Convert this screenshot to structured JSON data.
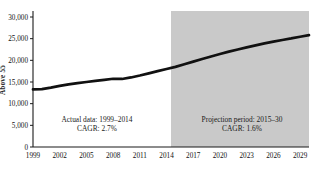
{
  "chart_data": {
    "type": "line",
    "title": "",
    "subtitle": "",
    "xlabel": "",
    "ylabel": "Above 55",
    "ylim": [
      0,
      30000
    ],
    "xlim": [
      1999,
      2030
    ],
    "ytick_labels": [
      "30,000",
      "25,000",
      "20,000",
      "15,000",
      "10,000",
      "5,000",
      "0"
    ],
    "ytick_values": [
      30000,
      25000,
      20000,
      15000,
      10000,
      5000,
      0
    ],
    "xtick_labels": [
      "1999",
      "2002",
      "2005",
      "2008",
      "2011",
      "2014",
      "2017",
      "2020",
      "2023",
      "2026",
      "2029"
    ],
    "xtick_values": [
      1999,
      2002,
      2005,
      2008,
      2011,
      2014,
      2017,
      2020,
      2023,
      2026,
      2029
    ],
    "grid": false,
    "legend_position": "none",
    "series": [
      {
        "name": "Above 55 population",
        "x": [
          1999,
          2000,
          2001,
          2002,
          2003,
          2004,
          2005,
          2006,
          2007,
          2008,
          2009,
          2010,
          2011,
          2012,
          2013,
          2014,
          2015,
          2016,
          2017,
          2018,
          2019,
          2020,
          2021,
          2022,
          2023,
          2024,
          2025,
          2026,
          2027,
          2028,
          2029,
          2030
        ],
        "values": [
          13300,
          13350,
          13700,
          14100,
          14450,
          14750,
          15000,
          15250,
          15500,
          15750,
          15700,
          16050,
          16500,
          17000,
          17500,
          18000,
          18500,
          19100,
          19700,
          20300,
          20900,
          21450,
          22000,
          22500,
          23000,
          23450,
          23900,
          24300,
          24700,
          25050,
          25450,
          25800
        ]
      }
    ],
    "shaded_region": {
      "label": "Projection period",
      "x_start": 2014.5,
      "x_end": 2030,
      "color": "#c9c9c9"
    },
    "annotations": [
      {
        "name": "actual-data-annotation",
        "line1": "Actual data: 1999–2014",
        "line2": "CAGR: 2.7%",
        "x_px": 97,
        "y_px": 122
      },
      {
        "name": "projection-annotation",
        "line1": "Projection period: 2015–30",
        "line2": "CAGR: 1.6%",
        "x_px": 242,
        "y_px": 122
      }
    ]
  }
}
